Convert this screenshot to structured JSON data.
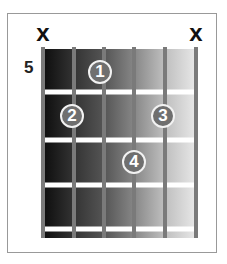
{
  "chord_diagram": {
    "starting_fret_label": "5",
    "string_count": 6,
    "string_x": [
      43,
      74,
      104,
      134,
      165,
      196
    ],
    "fret_y": [
      92,
      140,
      185,
      229
    ],
    "muted_strings": [
      {
        "string": 1,
        "x": 43,
        "symbol": "x"
      },
      {
        "string": 6,
        "x": 196,
        "symbol": "x"
      }
    ],
    "fingers": [
      {
        "label": "1",
        "string": 3,
        "fret": 1,
        "x": 100,
        "y": 72
      },
      {
        "label": "2",
        "string": 2,
        "fret": 2,
        "x": 72,
        "y": 116
      },
      {
        "label": "3",
        "string": 5,
        "fret": 2,
        "x": 163,
        "y": 116
      },
      {
        "label": "4",
        "string": 4,
        "fret": 3,
        "x": 134,
        "y": 162
      }
    ],
    "colors": {
      "finger_fill": "#6f6f6f",
      "finger_border": "#f2f2f2",
      "string": "#7a7a7a",
      "fret": "#ffffff",
      "board_dark": "#0d0d0d",
      "board_light": "#e8e8e8"
    }
  }
}
